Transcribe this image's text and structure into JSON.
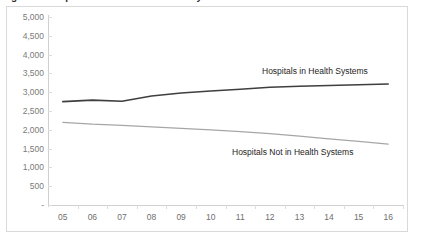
{
  "figure": {
    "clipped_title": "Figure 1. Hospitals in and not in Health Systems",
    "border_color": "#d9d9d9",
    "background": "#ffffff"
  },
  "chart_data": {
    "type": "line",
    "title": "",
    "xlabel": "",
    "ylabel": "",
    "categories": [
      "05",
      "06",
      "07",
      "08",
      "09",
      "10",
      "11",
      "12",
      "13",
      "14",
      "15",
      "16"
    ],
    "ylim": [
      0,
      5000
    ],
    "ytick_labels": [
      "-",
      "500",
      "1,000",
      "1,500",
      "2,000",
      "2,500",
      "3,000",
      "3,500",
      "4,000",
      "4,500",
      "5,000"
    ],
    "ytick_values": [
      0,
      500,
      1000,
      1500,
      2000,
      2500,
      3000,
      3500,
      4000,
      4500,
      5000
    ],
    "grid": false,
    "legend_position": "inline-annotation",
    "series": [
      {
        "name": "Hospitals in Health Systems",
        "color": "#3f3f3f",
        "values": [
          2750,
          2790,
          2760,
          2900,
          2980,
          3030,
          3080,
          3130,
          3160,
          3180,
          3200,
          3220
        ]
      },
      {
        "name": "Hospitals Not in Health Systems",
        "color": "#a6a6a6",
        "values": [
          2200,
          2150,
          2120,
          2080,
          2040,
          2000,
          1950,
          1900,
          1830,
          1760,
          1690,
          1620
        ]
      }
    ],
    "annotations": [
      {
        "text": "Hospitals in Health Systems",
        "series": "Hospitals in Health Systems"
      },
      {
        "text": "Hospitals Not in Health Systems",
        "series": "Hospitals Not in Health Systems"
      }
    ]
  }
}
